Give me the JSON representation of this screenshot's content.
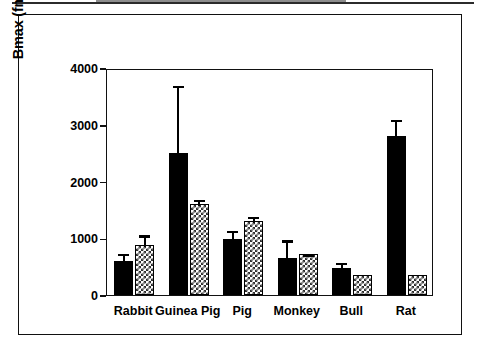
{
  "figure": {
    "background_color": "#ffffff",
    "frame_color": "#111111"
  },
  "chart_data": {
    "type": "bar",
    "title": "",
    "xlabel": "",
    "ylabel": "Bmax (fmol/mg protein)",
    "ylim": [
      0,
      4000
    ],
    "yticks": [
      0,
      1000,
      2000,
      3000,
      4000
    ],
    "ytick_labels": [
      "0",
      "1000",
      "2000",
      "3000",
      "4000"
    ],
    "grid": false,
    "legend": null,
    "categories": [
      "Rabbit",
      "Guinea Pig",
      "Pig",
      "Monkey",
      "Bull",
      "Rat"
    ],
    "series": [
      {
        "name": "solid-black",
        "fill": "solid-black",
        "color": "#000000",
        "values": [
          600,
          2500,
          980,
          660,
          480,
          2800
        ],
        "errors": [
          160,
          1220,
          190,
          340,
          120,
          320
        ]
      },
      {
        "name": "checkered-gray",
        "fill": "checkerboard",
        "color": "#2e2e2e",
        "values": [
          880,
          1600,
          1300,
          720,
          350,
          350
        ],
        "errors": [
          210,
          110,
          110,
          30,
          0,
          0
        ]
      }
    ]
  }
}
